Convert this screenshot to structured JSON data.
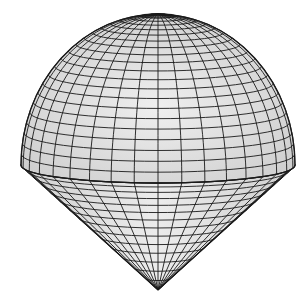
{
  "figure": {
    "colors": {
      "background": "#ffffff",
      "surface": "#dcdcdc",
      "surface_light": "#ececec",
      "grid_line": "#1a1a1a"
    },
    "geometry": {
      "center_x": 158,
      "equator_y": 165,
      "radius_x": 137,
      "radius_y_ellipse": 18,
      "dome_top_y": 14,
      "cone_apex_y": 290,
      "meridians": 36,
      "dome_parallels": 22,
      "cone_parallels": 14
    }
  }
}
